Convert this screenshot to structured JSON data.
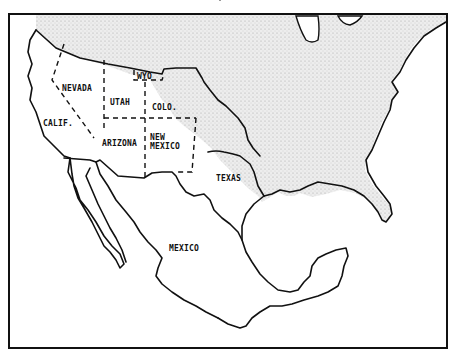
{
  "map": {
    "title": "",
    "labels": {
      "nevada": "NEVADA",
      "utah": "UTAH",
      "wyo": "WYO",
      "colo": "COLO.",
      "calif": "CALIF.",
      "arizona": "ARIZONA",
      "new_mexico_line1": "NEW",
      "new_mexico_line2": "MEXICO",
      "texas": "TEXAS",
      "mexico": "MEXICO"
    },
    "colors": {
      "stipple_land": "#e6e6e6",
      "ink": "#111111",
      "background": "#ffffff"
    },
    "legend": {
      "stippled_area": "United States (pre-cession)",
      "dashed_lines": "Future state boundaries"
    }
  }
}
